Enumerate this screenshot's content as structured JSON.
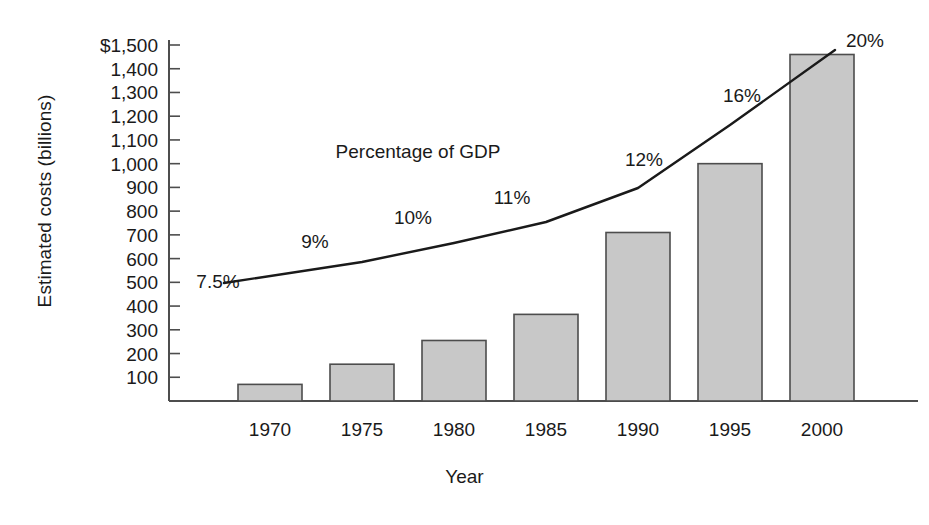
{
  "chart_data": {
    "type": "bar",
    "title": "",
    "xlabel": "Year",
    "ylabel": "Estimated costs (billions)",
    "categories": [
      "1970",
      "1975",
      "1980",
      "1985",
      "1990",
      "1995",
      "2000"
    ],
    "ylim": [
      0,
      1500
    ],
    "ytick_labels": [
      "$1,500",
      "1,400",
      "1,300",
      "1,200",
      "1,100",
      "1,000",
      "900",
      "800",
      "700",
      "600",
      "500",
      "400",
      "300",
      "200",
      "100"
    ],
    "ytick_values": [
      1500,
      1400,
      1300,
      1200,
      1100,
      1000,
      900,
      800,
      700,
      600,
      500,
      400,
      300,
      200,
      100
    ],
    "grid": false,
    "legend_position": "none",
    "series": [
      {
        "name": "Estimated costs (billions)",
        "type": "bar",
        "values": [
          70,
          155,
          255,
          365,
          710,
          1000,
          1460
        ]
      },
      {
        "name": "Percentage of GDP",
        "type": "line",
        "values": [
          7.5,
          9,
          10,
          11,
          12,
          16,
          20
        ],
        "labels": [
          "7.5%",
          "9%",
          "10%",
          "11%",
          "12%",
          "16%",
          "20%"
        ],
        "annotation": "Percentage of GDP"
      }
    ],
    "colors": {
      "bar_fill": "#c8c8c8",
      "bar_stroke": "#4d4d4d",
      "line_stroke": "#1a1a1a",
      "axis": "#4d4d4d",
      "text": "#1a1a1a",
      "background": "#ffffff"
    }
  }
}
